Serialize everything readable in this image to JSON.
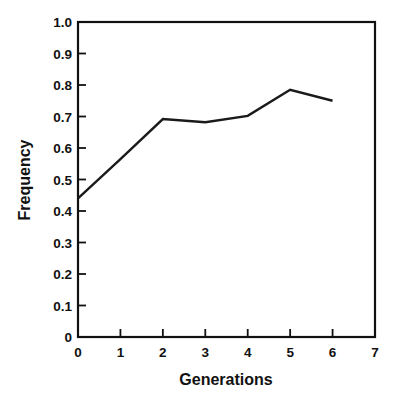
{
  "chart_data": {
    "type": "line",
    "title": "",
    "xlabel": "Generations",
    "ylabel": "Frequency",
    "x": [
      0,
      1,
      2,
      3,
      4,
      5,
      6
    ],
    "values": [
      0.44,
      0.565,
      0.692,
      0.682,
      0.702,
      0.785,
      0.75
    ],
    "series": [
      {
        "name": "Frequency",
        "values": [
          0.44,
          0.565,
          0.692,
          0.682,
          0.702,
          0.785,
          0.75
        ]
      }
    ],
    "xlim": [
      0,
      7
    ],
    "ylim": [
      0,
      1.0
    ],
    "xticks": [
      "0",
      "1",
      "2",
      "3",
      "4",
      "5",
      "6",
      "7"
    ],
    "xtick_values": [
      0,
      1,
      2,
      3,
      4,
      5,
      6,
      7
    ],
    "yticks": [
      "0",
      "0.1",
      "0.2",
      "0.3",
      "0.4",
      "0.5",
      "0.6",
      "0.7",
      "0.8",
      "0.9",
      "1.0"
    ],
    "ytick_values": [
      0,
      0.1,
      0.2,
      0.3,
      0.4,
      0.5,
      0.6,
      0.7,
      0.8,
      0.9,
      1.0
    ],
    "grid": false,
    "legend": null,
    "legend_position": "none",
    "line_color": "#1a1a1a",
    "axis_color": "#111111",
    "background_color": "#ffffff",
    "frame": "box",
    "tick_direction": "in",
    "annotations": []
  }
}
